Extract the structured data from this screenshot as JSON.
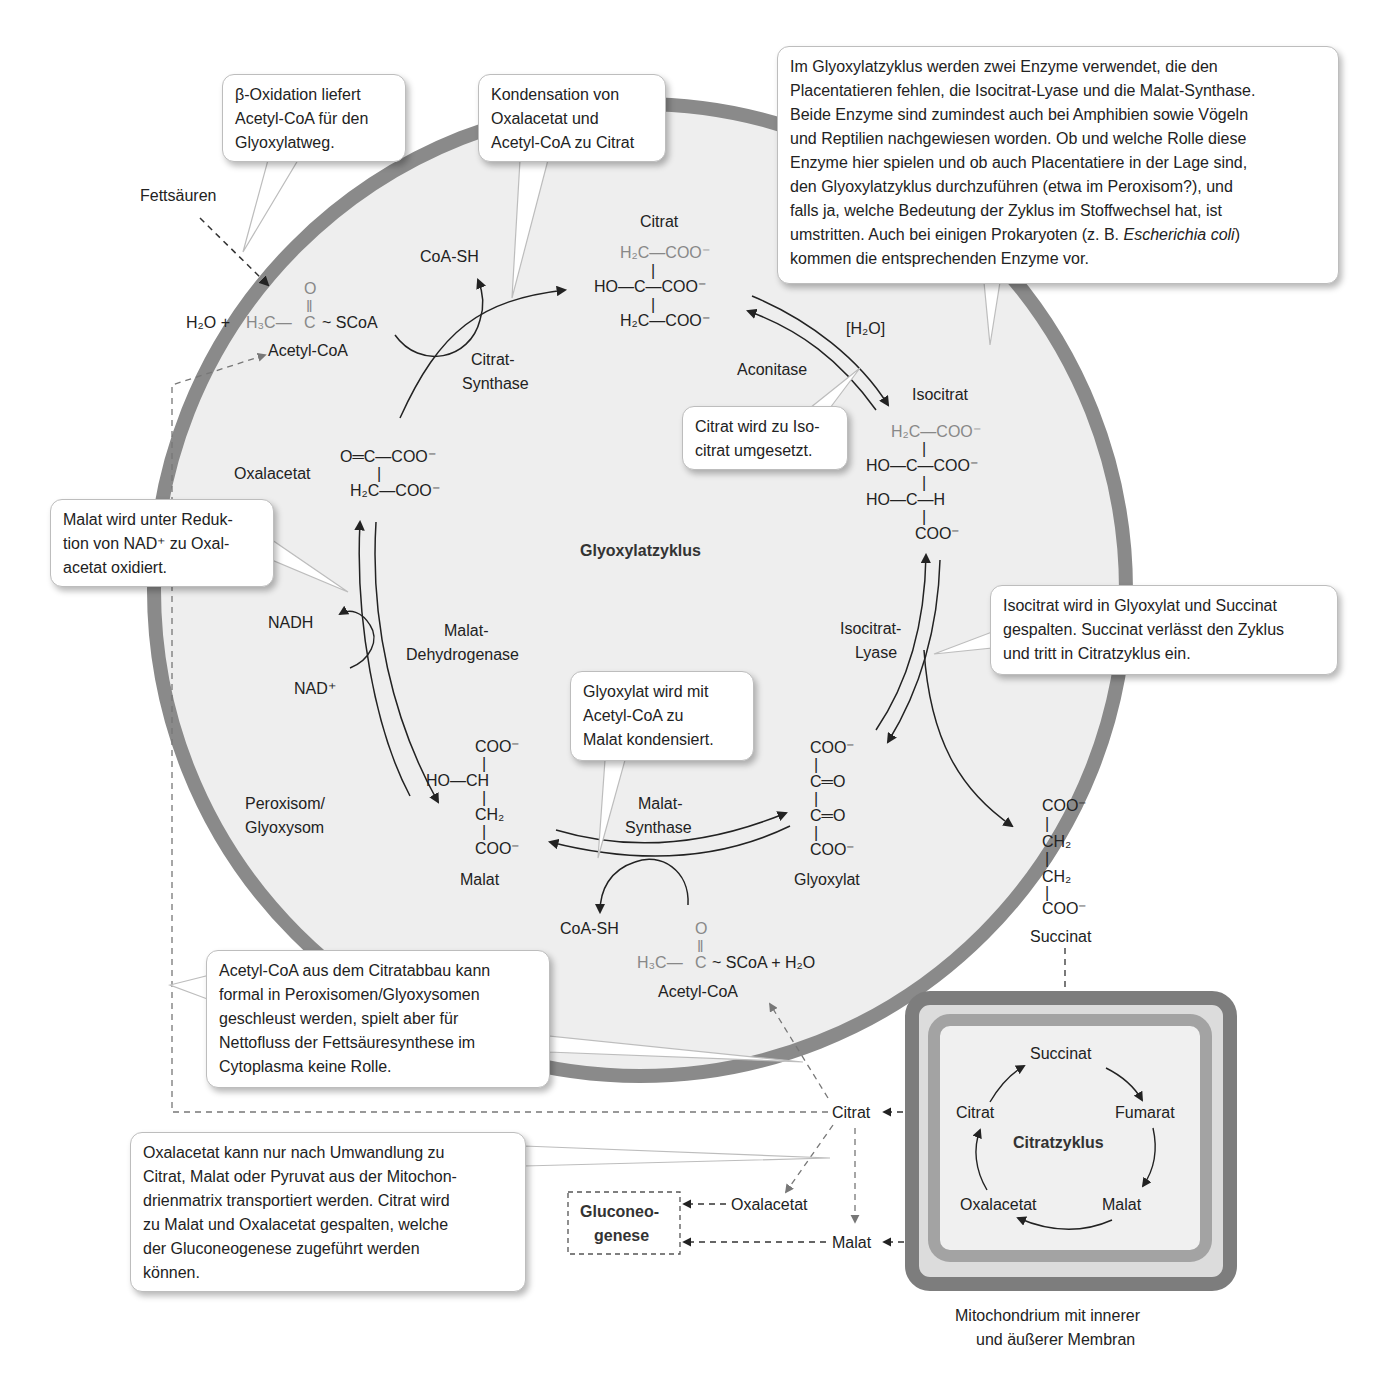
{
  "diagram": {
    "title": "Glyoxylatzyklus",
    "compartment_label": "Peroxisom/\nGlyoxysom",
    "colors": {
      "membrane": "#8a8a8a",
      "organelle_fill": "#eeeeee",
      "mito_outer": "#7d7d7d",
      "mito_inner_space": "#dcdcdc",
      "mito_inner": "#a3a3a3",
      "mito_matrix": "#f0f0f0",
      "callout_border": "#bdbdbd",
      "text": "#222222",
      "faded_chem": "#888888"
    },
    "inputs": {
      "fettsaeuren": "Fettsäuren",
      "acetyl_coa_1": {
        "prefix": "H₂O +",
        "formula_left": "H₃C",
        "bond": "—",
        "carbonyl": "C",
        "oxygen": "O",
        "suffix": "~ SCoA",
        "name": "Acetyl-CoA"
      },
      "acetyl_coa_2": {
        "formula_left": "H₃C",
        "carbonyl": "C",
        "oxygen": "O",
        "suffix": "~ SCoA  + H₂O",
        "name": "Acetyl-CoA"
      }
    },
    "metabolites": {
      "citrat": {
        "name": "Citrat",
        "lines": [
          "H₂C—COO⁻",
          "HO—C—COO⁻",
          "H₂C—COO⁻"
        ]
      },
      "isocitrat": {
        "name": "Isocitrat",
        "lines": [
          "H₂C—COO⁻",
          "HO—C—COO⁻",
          "HO—C—H",
          "COO⁻"
        ]
      },
      "oxalacetat": {
        "name": "Oxalacetat",
        "lines": [
          "O═C—COO⁻",
          "H₂C—COO⁻"
        ]
      },
      "malat": {
        "name": "Malat",
        "lines": [
          "COO⁻",
          "HO—CH",
          "CH₂",
          "COO⁻"
        ]
      },
      "glyoxylat": {
        "name": "Glyoxylat",
        "lines": [
          "COO⁻",
          "C═O",
          "C═O",
          "COO⁻"
        ]
      },
      "succinat": {
        "name": "Succinat",
        "lines": [
          "COO⁻",
          "CH₂",
          "CH₂",
          "COO⁻"
        ]
      }
    },
    "enzymes": {
      "citrat_synthase": "Citrat-\nSynthase",
      "aconitase": "Aconitase",
      "isocitrat_lyase": "Isocitrat-\nLyase",
      "malat_synthase": "Malat-\nSynthase",
      "malat_dehydrogenase": "Malat-\nDehydrogenase"
    },
    "cofactors": {
      "coa_sh_1": "CoA-SH",
      "coa_sh_2": "CoA-SH",
      "h2o_bracket": "[H₂O]",
      "nadh": "NADH",
      "nad": "NAD⁺"
    },
    "callouts": {
      "beta_oxidation": "β-Oxidation liefert\nAcetyl-CoA für den\nGlyoxylatweg.",
      "kondensation": "Kondensation von\nOxalacetat und\nAcetyl-CoA zu Citrat",
      "enzyme_info_part1": "Im Glyoxylatzyklus werden zwei Enzyme verwendet, die den\nPlacentatieren fehlen, die Isocitrat-Lyase und die Malat-Synthase.\nBeide Enzyme sind zumindest auch bei Amphibien sowie Vögeln\nund Reptilien nachgewiesen worden. Ob und welche Rolle diese\nEnzyme hier spielen und ob auch Placentatiere in der Lage sind,\nden Glyoxylatzyklus durchzuführen (etwa im Peroxisom?), und\nfalls ja, welche Bedeutung der Zyklus im Stoffwechsel hat, ist\numstritten. Auch bei einigen Prokaryoten (z. B. ",
      "enzyme_info_italic": "Escherichia coli",
      "enzyme_info_part2": ")\nkommen die entsprechenden Enzyme vor.",
      "citrat_isocitrat": "Citrat wird zu Iso-\ncitrat umgesetzt.",
      "malat_oxidiert": "Malat wird unter Reduk-\ntion von NAD⁺ zu Oxal-\nacetat oxidiert.",
      "isocitrat_gespalten": "Isocitrat wird in Glyoxylat und Succinat\ngespalten. Succinat verlässt den Zyklus\nund tritt in Citratzyklus ein.",
      "glyoxylat_kondensiert": "Glyoxylat wird mit\nAcetyl-CoA zu\nMalat kondensiert.",
      "acetyl_coa_citratabbau": "Acetyl-CoA aus dem Citratabbau kann\nformal in Peroxisomen/Glyoxysomen\ngeschleust werden, spielt aber für\nNettofluss der Fettsäuresynthese im\nCytoplasma keine Rolle.",
      "oxalacetat_transport": "Oxalacetat kann nur nach Umwandlung zu\nCitrat, Malat oder Pyruvat aus der Mitochon-\ndrienmatrix transportiert werden. Citrat wird\nzu Malat und Oxalacetat gespalten, welche\nder Gluconeogenese zugeführt werden\nkönnen."
    },
    "cytoplasm": {
      "citrat": "Citrat",
      "oxalacetat": "Oxalacetat",
      "malat": "Malat",
      "gluconeogenese": "Gluconeo-\ngenese"
    },
    "mitochondrium": {
      "title": "Citratzyklus",
      "nodes": {
        "succinat": "Succinat",
        "fumarat": "Fumarat",
        "malat": "Malat",
        "oxalacetat": "Oxalacetat",
        "citrat": "Citrat"
      },
      "caption": "Mitochondrium mit innerer\nund äußerer Membran"
    }
  }
}
